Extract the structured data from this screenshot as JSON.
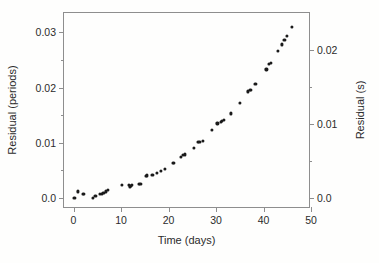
{
  "chart_data": {
    "type": "scatter",
    "title": "",
    "xlabel": "Time (days)",
    "ylabel": "Residual (periods)",
    "ylabel_right": "Residual (s)",
    "xlim": [
      -2,
      50
    ],
    "ylim": [
      -0.002,
      0.0335
    ],
    "ylim_right": [
      -0.0015,
      0.025
    ],
    "xticks": [
      0,
      10,
      20,
      30,
      40,
      50
    ],
    "xticklabels": [
      "0",
      "10",
      "20",
      "30",
      "40",
      "50"
    ],
    "yticks": [
      0.0,
      0.01,
      0.02,
      0.03
    ],
    "yticklabels": [
      "0.0",
      "0.01",
      "0.02",
      "0.03"
    ],
    "yminorticks": [
      0.005,
      0.015,
      0.025
    ],
    "yticks_right": [
      0.0,
      0.01,
      0.02
    ],
    "yticklabels_right": [
      "0.0",
      "0.01",
      "0.02"
    ],
    "yminorticks_right": [
      0.005,
      0.015
    ],
    "grid": false,
    "legend": false,
    "marker": "filled-circle",
    "marker_color": "#1a1a1a",
    "frame_color": "#8e8e8e",
    "background_color": "#fefefd",
    "x": [
      0.2,
      1.0,
      1.9,
      2.2,
      4.1,
      4.6,
      5.6,
      6.0,
      6.3,
      6.9,
      7.3,
      10.2,
      11.6,
      11.9,
      12.1,
      12.3,
      13.8,
      14.1,
      15.2,
      15.5,
      16.6,
      17.6,
      18.4,
      19.3,
      20.9,
      21.2,
      22.6,
      23.1,
      23.4,
      25.3,
      26.2,
      26.5,
      27.2,
      29.1,
      30.3,
      31.0,
      31.3,
      31.6,
      33.2,
      35.1,
      36.8,
      37.1,
      37.4,
      38.3,
      40.6,
      41.2,
      41.5,
      43.1,
      43.8,
      44.4,
      45.0,
      45.9
    ],
    "y": [
      0.0,
      0.0012,
      0.0008,
      0.0008,
      5e-05,
      0.0003,
      0.0007,
      0.0008,
      0.0009,
      0.0012,
      0.0014,
      0.0023,
      0.0023,
      0.0021,
      0.0022,
      0.0024,
      0.0026,
      0.0026,
      0.004,
      0.0041,
      0.0042,
      0.0046,
      0.0049,
      0.0053,
      0.0063,
      0.0064,
      0.0075,
      0.0078,
      0.0079,
      0.0091,
      0.0101,
      0.0102,
      0.0103,
      0.0123,
      0.0135,
      0.0138,
      0.014,
      0.0142,
      0.0153,
      0.0172,
      0.0193,
      0.0195,
      0.0196,
      0.0207,
      0.0233,
      0.0243,
      0.0245,
      0.0266,
      0.0278,
      0.0286,
      0.0294,
      0.031
    ]
  }
}
